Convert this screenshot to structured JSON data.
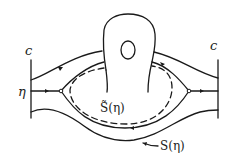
{
  "diagram": {
    "labels": {
      "c_left": "c",
      "c_right": "c",
      "eta": "η",
      "s_tilde_eta": "S̃(η)",
      "s_eta": "S(η)"
    },
    "colors": {
      "ink": "#1a1a1a",
      "background": "#ffffff"
    }
  }
}
